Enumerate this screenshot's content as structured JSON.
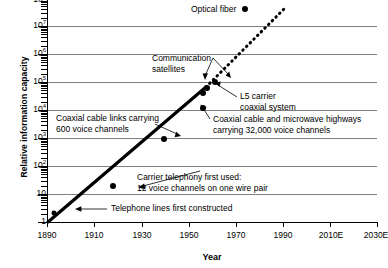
{
  "chart_data": {
    "type": "line",
    "title": "",
    "xlabel": "Year",
    "ylabel": "Relative information capacity",
    "xlim": [
      1890,
      2030
    ],
    "ylim": [
      1,
      100000000
    ],
    "yscale": "log",
    "grid": true,
    "legend": "none",
    "x_ticks": [
      "1890",
      "1910",
      "1930",
      "1950",
      "1970",
      "1990",
      "2010E",
      "2030E"
    ],
    "x_tick_values": [
      1890,
      1910,
      1930,
      1950,
      1970,
      1990,
      2010,
      2030
    ],
    "y_ticks": [
      "1",
      "10",
      "10",
      "10",
      "10",
      "10",
      "10",
      "10",
      "10"
    ],
    "y_tick_labels": [
      {
        "mantissa": "1",
        "exp": ""
      },
      {
        "mantissa": "10",
        "exp": ""
      },
      {
        "mantissa": "10",
        "exp": "2"
      },
      {
        "mantissa": "10",
        "exp": "3"
      },
      {
        "mantissa": "10",
        "exp": "4"
      },
      {
        "mantissa": "10",
        "exp": "5"
      },
      {
        "mantissa": "10",
        "exp": "6"
      },
      {
        "mantissa": "10",
        "exp": "7"
      },
      {
        "mantissa": "10",
        "exp": "8"
      }
    ],
    "y_tick_values": [
      1,
      10,
      100,
      1000,
      10000,
      100000,
      1000000,
      10000000,
      100000000
    ],
    "series": [
      {
        "name": "Historic trend",
        "style": "solid-thick",
        "x": [
          1890,
          2030
        ],
        "y": [
          1,
          100000000
        ],
        "note": "straight trend line on log scale from 1 at 1890 through the data points"
      },
      {
        "name": "Projection",
        "style": "dotted",
        "x": [
          1957,
          2023
        ],
        "y": [
          200000,
          40000000
        ],
        "note": "dotted extrapolation rising to upper right"
      }
    ],
    "points": [
      {
        "label": "Telephone lines first constructed",
        "year": 1893,
        "value": 2
      },
      {
        "label": "Carrier telephony first used: 12 voice channels on one wire pair",
        "year": 1918,
        "value": 12
      },
      {
        "label": "Coaxial cable links carrying 600 voice channels",
        "year": 1939,
        "value": 900
      },
      {
        "label": "Coaxial cable and microwave highways carrying 32,000 voice channels",
        "year": 1958,
        "value": 11000
      },
      {
        "label": "Communication satellites",
        "year": 1962,
        "value": 45000
      },
      {
        "label": "L5 carrier coaxial system",
        "year": 1966,
        "value": 130000
      },
      {
        "label": "L5 carrier coaxial system",
        "year": 1968,
        "value": 160000
      },
      {
        "label": "Optical fiber",
        "year": null,
        "value": null,
        "legend_marker": true
      }
    ],
    "annotations": [
      {
        "name": "optical-fiber",
        "text": "Optical fiber"
      },
      {
        "name": "communication-satellites",
        "line1": "Communication",
        "line2": "satellites"
      },
      {
        "name": "l5-carrier",
        "line1": "L5 carrier",
        "line2": "coaxial system"
      },
      {
        "name": "coaxial-600",
        "line1": "Coaxial cable links carrying",
        "line2": "600 voice channels"
      },
      {
        "name": "coaxial-microwave",
        "line1": "Coaxial cable and microwave highways",
        "line2": "carrying 32,000 voice channels"
      },
      {
        "name": "carrier-telephony",
        "line1": "Carrier  telephony first used:",
        "line2": "12 voice channels on one wire pair"
      },
      {
        "name": "telephone-lines",
        "line1": "Telephone lines first constructed",
        "line2": ""
      }
    ],
    "colors": {
      "line": "#000000",
      "grid": "#808080",
      "axis": "#000000",
      "background": "#ffffff",
      "marker": "#000000"
    }
  }
}
